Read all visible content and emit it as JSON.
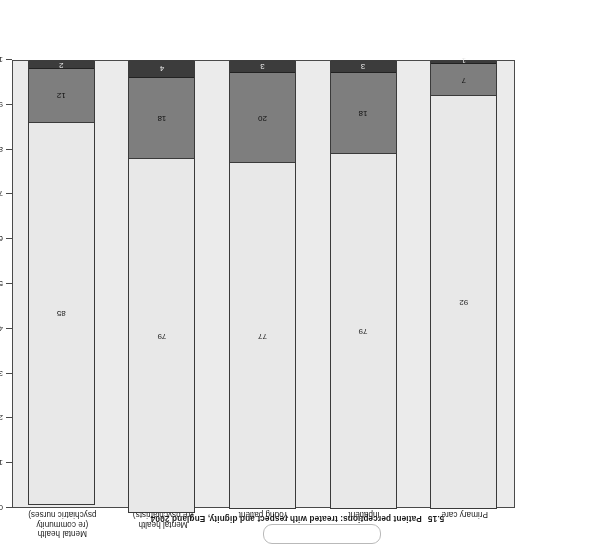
{
  "chart_data": {
    "type": "bar",
    "subtype": "stacked-bar",
    "title_number": "5.15",
    "title_text": "Patient perceptions: treated with respect and dignity, England 2004",
    "xlabel": "",
    "ylabel": "% respondents",
    "ylim": [
      0,
      100
    ],
    "yticks": [
      0,
      10,
      20,
      30,
      40,
      50,
      60,
      70,
      80,
      90,
      100
    ],
    "ytick_labels": [
      "0",
      "10",
      "20",
      "30",
      "40",
      "50",
      "60",
      "70",
      "80",
      "90",
      "100"
    ],
    "grid": false,
    "legend": "none",
    "orientation": "vertical",
    "rotated_180": true,
    "categories": [
      "Primary care",
      "Inpatient",
      "Young patient",
      "Mental health (re psychiatrists)",
      "Mental health (re community psychiatric nurses)"
    ],
    "category_lines": [
      [
        "Primary care"
      ],
      [
        "Inpatient"
      ],
      [
        "Young patient"
      ],
      [
        "Mental health",
        "(re psychiatrists)"
      ],
      [
        "Mental health",
        "(re community",
        "psychiatric nurses)"
      ]
    ],
    "series": [
      {
        "name": "segment-1",
        "color": "#e8e8e8",
        "values": [
          92,
          79,
          77,
          79,
          85
        ]
      },
      {
        "name": "segment-2",
        "color": "#7e7e7e",
        "values": [
          7,
          18,
          20,
          18,
          12
        ]
      },
      {
        "name": "segment-3",
        "color": "#3c3c3c",
        "values": [
          1,
          3,
          3,
          4,
          2
        ]
      }
    ],
    "colors": {
      "segment_1": "#e8e8e8",
      "segment_2": "#7e7e7e",
      "segment_3": "#3c3c3c",
      "plot_background": "#ebebeb",
      "axis": "#4a4a4a",
      "text": "#1c1c1c"
    }
  }
}
